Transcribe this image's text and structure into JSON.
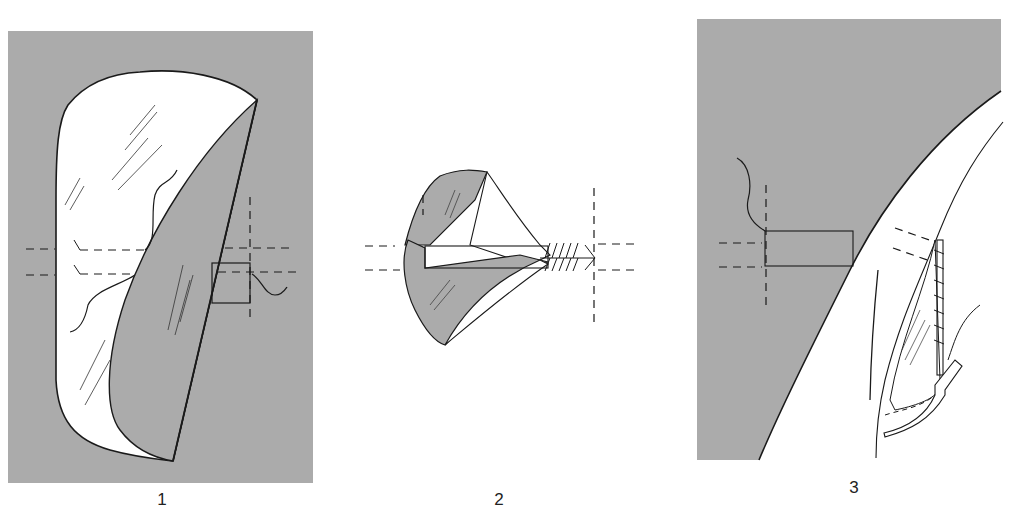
{
  "figure": {
    "panels": [
      {
        "id": 1,
        "label": "1",
        "description": "Flap shape outlined on shaded skin area with dashed incision guide lines"
      },
      {
        "id": 2,
        "label": "2",
        "description": "Flap rolled/folded toward sutured pedicle between dashed guide lines"
      },
      {
        "id": 3,
        "label": "3",
        "description": "Flap transposed with sutured edge and drain along curved border"
      }
    ],
    "colors": {
      "shading": "#ababab",
      "line": "#1a1a1a",
      "background": "#ffffff"
    }
  }
}
